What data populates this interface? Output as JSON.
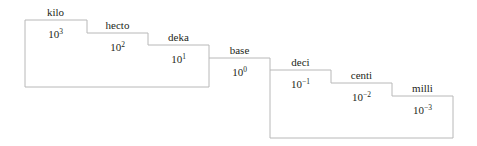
{
  "diagram": {
    "title": "",
    "line_color": "#b8b8b8",
    "text_color": "#231f20",
    "steps": [
      {
        "prefix": "kilo",
        "base": "10",
        "exponent": "3"
      },
      {
        "prefix": "hecto",
        "base": "10",
        "exponent": "2"
      },
      {
        "prefix": "deka",
        "base": "10",
        "exponent": "1"
      },
      {
        "prefix": "base",
        "base": "10",
        "exponent": "0"
      },
      {
        "prefix": "deci",
        "base": "10",
        "exponent": "−1"
      },
      {
        "prefix": "centi",
        "base": "10",
        "exponent": "−2"
      },
      {
        "prefix": "milli",
        "base": "10",
        "exponent": "−3"
      }
    ]
  }
}
